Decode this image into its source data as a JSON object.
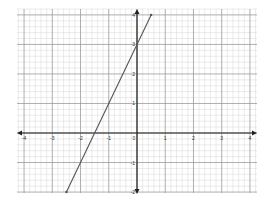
{
  "chart_data": {
    "type": "line",
    "title": "",
    "xlabel": "",
    "ylabel": "",
    "xlim": [
      -4,
      4
    ],
    "ylim": [
      -2,
      4
    ],
    "grid": true,
    "grid_minor_subdivisions": 5,
    "x_ticks": [
      -4,
      -3,
      -2,
      -1,
      0,
      1,
      2,
      3,
      4
    ],
    "y_ticks": [
      -2,
      -1,
      1,
      2,
      3,
      4
    ],
    "x_tick_labels": [
      "-4",
      "-3",
      "-2",
      "-1",
      "0",
      "1",
      "2",
      "3",
      "4"
    ],
    "y_tick_labels": [
      "-2",
      "-1",
      "1",
      "2",
      "3",
      "4"
    ],
    "series": [
      {
        "name": "y = 2x + 3",
        "equation": "y = 2x + 3",
        "slope": 2,
        "intercept": 3,
        "x": [
          -2.5,
          0.5
        ],
        "y": [
          -2,
          4
        ],
        "color": "#555555"
      }
    ],
    "legend": null
  },
  "colors": {
    "axis": "#222222",
    "major_grid": "#9a9a9a",
    "minor_grid": "#d6d6d6",
    "line": "#555555"
  }
}
